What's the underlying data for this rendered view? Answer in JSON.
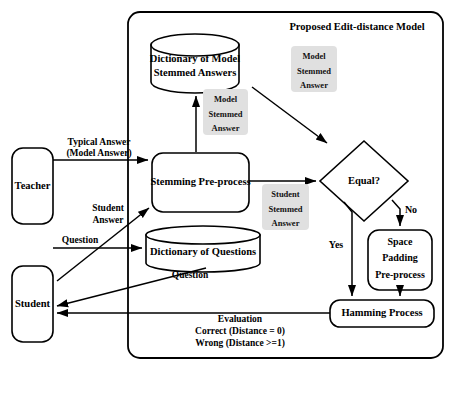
{
  "diagram": {
    "title": "Proposed Edit-distance Model",
    "actors": {
      "teacher": "Teacher",
      "student": "Student"
    },
    "nodes": {
      "dict_model_line1": "Dictionary of Model",
      "dict_model_line2": "Stemmed Answers",
      "stemming": "Stemming Pre-process",
      "dict_questions": "Dictionary of Questions",
      "decision": "Equal?",
      "space_padding_line1": "Space",
      "space_padding_line2": "Padding",
      "space_padding_line3": "Pre-process",
      "hamming": "Hamming Process"
    },
    "chips": {
      "model_stemmed_up": {
        "line1": "Model",
        "line2": "Stemmed",
        "line3": "Answer"
      },
      "model_stemmed_right": {
        "line1": "Model",
        "line2": "Stemmed",
        "line3": "Answer"
      },
      "student_stemmed": {
        "line1": "Student",
        "line2": "Stemmed",
        "line3": "Answer"
      }
    },
    "edge_labels": {
      "typical_answer_line1": "Typical Answer",
      "typical_answer_line2": "(Model Answer)",
      "student_answer_line1": "Student",
      "student_answer_line2": "Answer",
      "question_teacher": "Question",
      "question_student": "Question",
      "yes": "Yes",
      "no": "No",
      "evaluation_line1": "Evaluation",
      "evaluation_line2": "Correct (Distance = 0)",
      "evaluation_line3": "Wrong (Distance >=1)"
    },
    "colors": {
      "stroke": "#000000",
      "fill": "#ffffff",
      "chip_fill": "#e0e0e0",
      "background": "#ffffff"
    }
  }
}
